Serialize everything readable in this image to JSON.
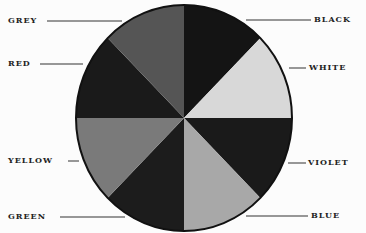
{
  "diagram": {
    "type": "color-wheel",
    "center": [
      184,
      118
    ],
    "radius_x": 108,
    "radius_y": 113,
    "segments": [
      {
        "name": "BLACK",
        "fill": "#141414",
        "start_deg": 0,
        "end_deg": 45
      },
      {
        "name": "WHITE",
        "fill": "#d8d8d8",
        "start_deg": 45,
        "end_deg": 90
      },
      {
        "name": "VIOLET",
        "fill": "#1a1a1a",
        "start_deg": 90,
        "end_deg": 135
      },
      {
        "name": "BLUE",
        "fill": "#a8a8a8",
        "start_deg": 135,
        "end_deg": 180
      },
      {
        "name": "GREEN",
        "fill": "#1c1c1c",
        "start_deg": 180,
        "end_deg": 225
      },
      {
        "name": "YELLOW",
        "fill": "#7a7a7a",
        "start_deg": 225,
        "end_deg": 270
      },
      {
        "name": "RED",
        "fill": "#1a1a1a",
        "start_deg": 270,
        "end_deg": 315
      },
      {
        "name": "GREY",
        "fill": "#555555",
        "start_deg": 315,
        "end_deg": 360
      }
    ]
  },
  "labels": {
    "grey": "GREY",
    "red": "RED",
    "yellow": "YELLOW",
    "green": "GREEN",
    "black": "BLACK",
    "white": "WHITE",
    "violet": "VIOLET",
    "blue": "BLUE"
  }
}
